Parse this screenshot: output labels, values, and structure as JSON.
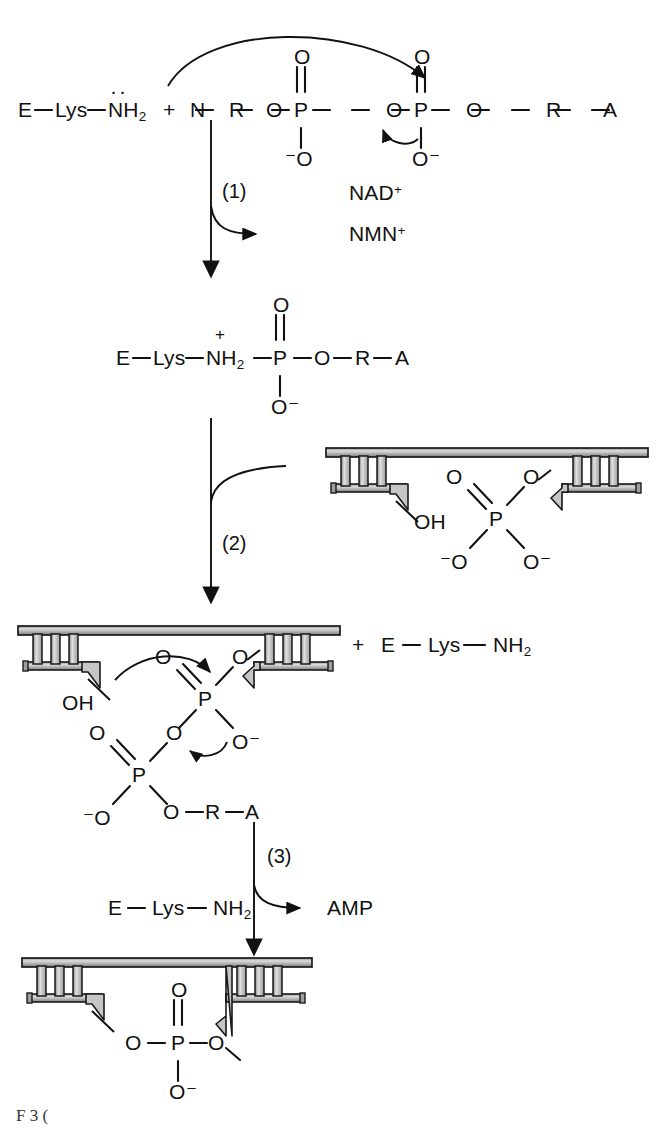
{
  "figure": {
    "caption_partial": "F         3 (",
    "colors": {
      "ink": "#111111",
      "dna_fill": "#b9b9b9",
      "dna_fill_light": "#d6d6d6",
      "dna_outline": "#1a1a1a",
      "background": "#ffffff"
    }
  },
  "steps": [
    {
      "id": "step1",
      "label": "(1)",
      "byproduct": "NMN+",
      "cofactor": "NAD+"
    },
    {
      "id": "step2",
      "label": "(2)",
      "substrate": "nicked DNA duplex"
    },
    {
      "id": "step3",
      "label": "(3)",
      "byproduct": "AMP",
      "reagent": "E — Lys — NH2"
    }
  ],
  "panel1": {
    "enzyme": {
      "E": "E",
      "dash1": "—",
      "Lys": "Lys",
      "dash2": "—",
      "NH2": "NH",
      "NH2_sub": "2",
      "lone_pair": "··"
    },
    "plus": "+",
    "chain": [
      "N",
      "—",
      "R",
      "—",
      "O",
      "—",
      "P",
      "—",
      "O",
      "—",
      "P",
      "—",
      "O",
      "—",
      "R",
      "—",
      "A"
    ],
    "p1_double_o": "O",
    "p1_minus_o": "⁻O",
    "p2_double_o": "O",
    "p2_o_minus": "O⁻",
    "cofactor": "NAD",
    "cofactor_sup": "+",
    "byproduct": "NMN",
    "byproduct_sup": "+",
    "step_label": "(1)"
  },
  "panel2": {
    "adduct": [
      "E",
      "—",
      "Lys",
      "—",
      "NH",
      "—",
      "P",
      "—",
      "O",
      "—",
      "R",
      "—",
      "A"
    ],
    "nh2_sub": "2",
    "n_plus": "+",
    "p_double_o": "O",
    "p_o_minus": "O⁻",
    "step_label": "(2)",
    "dna": {
      "oh_label": "OH"
    },
    "phosphate": {
      "double_o": "O",
      "ester_o": "O",
      "center": "P",
      "minus_o_left": "⁻O",
      "o_minus_right": "O⁻"
    }
  },
  "panel3": {
    "dna": {
      "oh_label": "OH"
    },
    "plus": "+",
    "enzyme": [
      "E",
      "—",
      "Lys",
      "—",
      "NH"
    ],
    "enzyme_sub": "2",
    "upper_p": {
      "double_o": "O",
      "bridge_o": "O",
      "center": "P",
      "o_minus": "O⁻"
    },
    "lower_p": {
      "double_o": "O",
      "center": "P",
      "minus_o": "⁻O",
      "chain": [
        "O",
        "—",
        "R",
        "—",
        "A"
      ]
    },
    "step_label": "(3)",
    "byproduct": "AMP",
    "reagent": [
      "E",
      "—",
      "Lys",
      "—",
      "NH"
    ],
    "reagent_sub": "2"
  },
  "panel4": {
    "product_bond": {
      "double_o": "O",
      "left_o": "O",
      "dash_left": "—",
      "center": "P",
      "dash_right": "—",
      "right_o": "O",
      "o_minus": "O⁻"
    }
  }
}
